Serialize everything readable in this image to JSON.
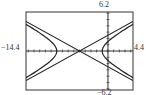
{
  "chart_data": {
    "type": "line",
    "title": "",
    "xlabel": "",
    "ylabel": "",
    "xlim": [
      -14.4,
      4.4
    ],
    "ylim": [
      -6.2,
      6.2
    ],
    "tick_labels": {
      "xmin": "-14.4",
      "xmax": "4.4",
      "ymax": "6.2",
      "ymin": "-6.2"
    },
    "grid": false,
    "legend": null,
    "series": [
      {
        "name": "hyperbola",
        "equation": "(x+5)^2/16 - y^2/4 = 1",
        "center": [
          -5,
          0
        ],
        "a": 4,
        "b": 2
      },
      {
        "name": "asymptote-1",
        "equation": "y = 0.5(x+5)"
      },
      {
        "name": "asymptote-2",
        "equation": "y = -0.5(x+5)"
      }
    ]
  },
  "labels": {
    "xmin": "−14.4",
    "xmax": "4.4",
    "ymax": "6.2",
    "ymin": "−6.2"
  }
}
